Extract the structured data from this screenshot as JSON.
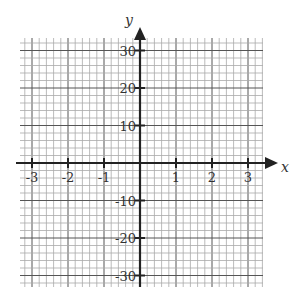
{
  "chart_data": {
    "type": "grid",
    "title": "",
    "xlabel": "x",
    "ylabel": "y",
    "xlim": [
      -3.33,
      3.4
    ],
    "ylim": [
      -33,
      33
    ],
    "x_ticks": [
      -3,
      -2,
      -1,
      1,
      2,
      3
    ],
    "x_tick_labels": [
      "-3",
      "-2",
      "-1",
      "1",
      "2",
      "3"
    ],
    "y_ticks": [
      30,
      20,
      10,
      -10,
      -20,
      -30
    ],
    "y_tick_labels": [
      "30",
      "20",
      "10",
      "-10",
      "-20",
      "-30"
    ],
    "grid": true,
    "x_minor_step": 0.2,
    "y_minor_step": 2,
    "series": []
  },
  "colors": {
    "axis": "#222222",
    "minor_grid": "#aaaaaa",
    "major_grid": "#555555",
    "label": "#333333"
  }
}
